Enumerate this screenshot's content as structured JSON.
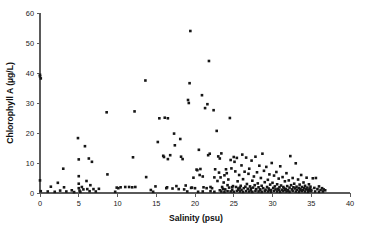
{
  "chart_data": {
    "type": "scatter",
    "title": "",
    "xlabel": "Salinity (psu)",
    "ylabel": "Chlorophyll A (µg/L)",
    "xlim": [
      0,
      40
    ],
    "ylim": [
      0,
      60
    ],
    "xticks": [
      0,
      5,
      10,
      15,
      20,
      25,
      30,
      35,
      40
    ],
    "yticks": [
      0,
      10,
      20,
      30,
      40,
      50,
      60
    ],
    "xtick_labels": [
      "0",
      "5",
      "10",
      "15",
      "20",
      "25",
      "30",
      "35",
      "40"
    ],
    "ytick_labels": [
      "0",
      "10",
      "20",
      "30",
      "40",
      "50",
      "60"
    ],
    "grid": false,
    "legend": false,
    "marker": {
      "shape": "square",
      "color": "#161616",
      "size": 2.6
    },
    "axis_color": "#5a5a5a",
    "background_color": "#ffffff",
    "series": [
      {
        "name": "Chlorophyll A vs Salinity",
        "points": [
          [
            0.0,
            39.4
          ],
          [
            0.0,
            38.9
          ],
          [
            0.1,
            38.2
          ],
          [
            0.0,
            4.2
          ],
          [
            0.1,
            0.6
          ],
          [
            1.0,
            0.5
          ],
          [
            1.4,
            2.1
          ],
          [
            1.9,
            0.4
          ],
          [
            2.3,
            3.4
          ],
          [
            2.6,
            0.8
          ],
          [
            3.0,
            8.1
          ],
          [
            3.1,
            1.9
          ],
          [
            3.4,
            0.5
          ],
          [
            4.1,
            0.9
          ],
          [
            4.4,
            0.3
          ],
          [
            4.9,
            18.3
          ],
          [
            5.0,
            11.2
          ],
          [
            5.0,
            5.6
          ],
          [
            5.0,
            3.1
          ],
          [
            5.0,
            1.6
          ],
          [
            5.1,
            0.8
          ],
          [
            5.2,
            0.4
          ],
          [
            5.4,
            2.0
          ],
          [
            5.6,
            1.2
          ],
          [
            5.8,
            15.6
          ],
          [
            6.0,
            4.0
          ],
          [
            6.1,
            1.3
          ],
          [
            6.3,
            11.5
          ],
          [
            6.4,
            0.6
          ],
          [
            6.5,
            2.6
          ],
          [
            6.7,
            10.4
          ],
          [
            6.9,
            1.3
          ],
          [
            7.2,
            0.5
          ],
          [
            7.6,
            1.4
          ],
          [
            8.6,
            26.9
          ],
          [
            8.7,
            6.2
          ],
          [
            9.7,
            0.4
          ],
          [
            9.9,
            1.8
          ],
          [
            10.1,
            1.6
          ],
          [
            10.4,
            1.9
          ],
          [
            11.0,
            2.0
          ],
          [
            11.5,
            2.0
          ],
          [
            11.9,
            1.9
          ],
          [
            12.0,
            11.9
          ],
          [
            12.2,
            27.2
          ],
          [
            12.3,
            2.0
          ],
          [
            13.6,
            37.5
          ],
          [
            13.7,
            5.3
          ],
          [
            14.3,
            1.0
          ],
          [
            14.6,
            0.4
          ],
          [
            14.9,
            2.2
          ],
          [
            15.2,
            17.0
          ],
          [
            15.4,
            24.9
          ],
          [
            15.9,
            12.4
          ],
          [
            16.0,
            12.0
          ],
          [
            16.1,
            25.1
          ],
          [
            16.3,
            1.6
          ],
          [
            16.4,
            1.9
          ],
          [
            16.5,
            24.9
          ],
          [
            16.5,
            11.3
          ],
          [
            16.8,
            12.6
          ],
          [
            17.1,
            1.5
          ],
          [
            17.3,
            19.8
          ],
          [
            17.4,
            15.9
          ],
          [
            17.6,
            2.3
          ],
          [
            17.9,
            1.3
          ],
          [
            18.1,
            18.0
          ],
          [
            18.2,
            12.1
          ],
          [
            18.4,
            11.3
          ],
          [
            18.6,
            1.2
          ],
          [
            18.8,
            2.5
          ],
          [
            19.1,
            31.0
          ],
          [
            19.2,
            30.0
          ],
          [
            19.3,
            36.6
          ],
          [
            19.4,
            54.0
          ],
          [
            19.5,
            1.7
          ],
          [
            19.6,
            1.8
          ],
          [
            19.8,
            5.1
          ],
          [
            20.0,
            1.6
          ],
          [
            20.2,
            7.8
          ],
          [
            20.3,
            7.6
          ],
          [
            20.5,
            14.4
          ],
          [
            20.6,
            6.0
          ],
          [
            20.7,
            8.0
          ],
          [
            20.9,
            32.6
          ],
          [
            21.0,
            5.5
          ],
          [
            21.1,
            1.9
          ],
          [
            21.3,
            28.3
          ],
          [
            21.5,
            1.6
          ],
          [
            21.6,
            29.6
          ],
          [
            21.7,
            12.6
          ],
          [
            21.8,
            44.0
          ],
          [
            21.9,
            13.1
          ],
          [
            22.0,
            2.0
          ],
          [
            22.2,
            1.6
          ],
          [
            22.4,
            27.6
          ],
          [
            22.5,
            5.2
          ],
          [
            22.6,
            7.9
          ],
          [
            22.8,
            20.7
          ],
          [
            22.9,
            4.0
          ],
          [
            23.0,
            12.2
          ],
          [
            23.1,
            6.8
          ],
          [
            23.2,
            11.5
          ],
          [
            23.3,
            5.2
          ],
          [
            23.4,
            13.2
          ],
          [
            23.5,
            2.0
          ],
          [
            23.6,
            1.4
          ],
          [
            23.7,
            3.5
          ],
          [
            23.8,
            5.9
          ],
          [
            23.9,
            1.2
          ],
          [
            24.0,
            7.9
          ],
          [
            24.1,
            6.6
          ],
          [
            24.2,
            2.6
          ],
          [
            24.3,
            4.5
          ],
          [
            24.4,
            1.8
          ],
          [
            24.5,
            25.0
          ],
          [
            24.6,
            11.0
          ],
          [
            24.7,
            8.2
          ],
          [
            24.8,
            1.9
          ],
          [
            24.9,
            2.3
          ],
          [
            25.0,
            12.0
          ],
          [
            25.1,
            10.4
          ],
          [
            25.2,
            7.2
          ],
          [
            25.3,
            2.0
          ],
          [
            25.4,
            11.7
          ],
          [
            25.5,
            3.9
          ],
          [
            25.6,
            1.5
          ],
          [
            25.7,
            6.0
          ],
          [
            25.8,
            1.8
          ],
          [
            25.9,
            2.4
          ],
          [
            26.0,
            9.2
          ],
          [
            26.1,
            12.8
          ],
          [
            26.2,
            4.6
          ],
          [
            26.3,
            1.6
          ],
          [
            26.4,
            7.1
          ],
          [
            26.5,
            2.1
          ],
          [
            26.6,
            11.8
          ],
          [
            26.7,
            3.0
          ],
          [
            26.8,
            1.4
          ],
          [
            26.9,
            6.4
          ],
          [
            27.0,
            8.1
          ],
          [
            27.1,
            2.2
          ],
          [
            27.2,
            1.5
          ],
          [
            27.3,
            10.8
          ],
          [
            27.4,
            4.1
          ],
          [
            27.5,
            1.8
          ],
          [
            27.6,
            5.5
          ],
          [
            27.7,
            2.6
          ],
          [
            27.8,
            12.1
          ],
          [
            27.9,
            1.3
          ],
          [
            28.0,
            6.9
          ],
          [
            28.1,
            3.2
          ],
          [
            28.2,
            1.9
          ],
          [
            28.3,
            9.1
          ],
          [
            28.4,
            1.2
          ],
          [
            28.5,
            5.0
          ],
          [
            28.6,
            2.4
          ],
          [
            28.7,
            13.1
          ],
          [
            28.8,
            1.6
          ],
          [
            28.9,
            7.4
          ],
          [
            29.0,
            3.6
          ],
          [
            29.1,
            1.1
          ],
          [
            29.2,
            8.7
          ],
          [
            29.3,
            2.0
          ],
          [
            29.4,
            4.4
          ],
          [
            29.5,
            1.5
          ],
          [
            29.6,
            6.2
          ],
          [
            29.7,
            2.8
          ],
          [
            29.8,
            1.0
          ],
          [
            29.9,
            10.0
          ],
          [
            30.0,
            3.4
          ],
          [
            30.1,
            1.7
          ],
          [
            30.2,
            5.8
          ],
          [
            30.3,
            2.2
          ],
          [
            30.4,
            1.2
          ],
          [
            30.5,
            7.0
          ],
          [
            30.6,
            2.9
          ],
          [
            30.7,
            1.4
          ],
          [
            30.8,
            4.8
          ],
          [
            30.9,
            1.9
          ],
          [
            31.0,
            8.9
          ],
          [
            31.1,
            2.5
          ],
          [
            31.2,
            1.1
          ],
          [
            31.3,
            5.3
          ],
          [
            31.4,
            2.0
          ],
          [
            31.5,
            1.6
          ],
          [
            31.6,
            3.9
          ],
          [
            31.7,
            1.3
          ],
          [
            31.8,
            6.6
          ],
          [
            31.9,
            2.3
          ],
          [
            32.0,
            1.0
          ],
          [
            32.1,
            4.2
          ],
          [
            32.2,
            1.8
          ],
          [
            32.3,
            12.3
          ],
          [
            32.4,
            2.6
          ],
          [
            32.5,
            1.2
          ],
          [
            32.6,
            5.0
          ],
          [
            32.7,
            1.9
          ],
          [
            32.8,
            3.1
          ],
          [
            32.9,
            1.5
          ],
          [
            33.0,
            9.9
          ],
          [
            33.1,
            2.1
          ],
          [
            33.2,
            1.1
          ],
          [
            33.3,
            4.5
          ],
          [
            33.4,
            1.7
          ],
          [
            33.5,
            2.8
          ],
          [
            33.6,
            1.3
          ],
          [
            33.7,
            6.0
          ],
          [
            33.8,
            2.0
          ],
          [
            33.9,
            1.0
          ],
          [
            34.0,
            3.5
          ],
          [
            34.1,
            1.6
          ],
          [
            34.2,
            2.4
          ],
          [
            34.3,
            1.2
          ],
          [
            34.4,
            5.1
          ],
          [
            34.5,
            1.8
          ],
          [
            34.6,
            1.0
          ],
          [
            34.7,
            2.9
          ],
          [
            34.8,
            1.4
          ],
          [
            34.9,
            2.1
          ],
          [
            35.0,
            1.1
          ],
          [
            35.2,
            4.9
          ],
          [
            35.4,
            1.7
          ],
          [
            35.6,
            5.0
          ],
          [
            35.8,
            1.3
          ],
          [
            36.0,
            2.2
          ],
          [
            36.2,
            1.0
          ],
          [
            36.4,
            1.6
          ],
          [
            36.6,
            1.2
          ],
          [
            36.8,
            0.9
          ],
          [
            23.4,
            0.5
          ],
          [
            23.8,
            0.4
          ],
          [
            24.2,
            0.6
          ],
          [
            24.6,
            0.5
          ],
          [
            25.0,
            0.4
          ],
          [
            25.4,
            0.7
          ],
          [
            25.8,
            0.5
          ],
          [
            26.2,
            0.4
          ],
          [
            26.6,
            0.6
          ],
          [
            27.0,
            0.5
          ],
          [
            27.4,
            0.4
          ],
          [
            27.8,
            0.7
          ],
          [
            28.2,
            0.5
          ],
          [
            28.6,
            0.4
          ],
          [
            29.0,
            0.6
          ],
          [
            29.4,
            0.5
          ],
          [
            29.8,
            0.4
          ],
          [
            30.2,
            0.7
          ],
          [
            30.6,
            0.5
          ],
          [
            31.0,
            0.4
          ],
          [
            31.4,
            0.6
          ],
          [
            31.8,
            0.5
          ],
          [
            32.2,
            0.4
          ],
          [
            32.6,
            0.7
          ],
          [
            33.0,
            0.5
          ],
          [
            33.4,
            0.4
          ],
          [
            33.8,
            0.6
          ],
          [
            34.2,
            0.5
          ],
          [
            34.6,
            0.4
          ],
          [
            35.0,
            0.6
          ],
          [
            35.5,
            0.5
          ],
          [
            36.0,
            0.4
          ],
          [
            36.5,
            0.5
          ],
          [
            22.0,
            0.6
          ],
          [
            22.5,
            0.4
          ],
          [
            21.0,
            0.5
          ],
          [
            20.4,
            0.4
          ],
          [
            19.0,
            0.5
          ],
          [
            26.0,
            1.0
          ],
          [
            27.2,
            0.9
          ],
          [
            28.4,
            1.0
          ],
          [
            29.6,
            0.9
          ],
          [
            30.8,
            1.0
          ],
          [
            32.0,
            0.8
          ],
          [
            33.6,
            0.9
          ],
          [
            34.8,
            0.8
          ],
          [
            25.6,
            1.1
          ],
          [
            24.8,
            1.0
          ],
          [
            23.2,
            0.9
          ],
          [
            31.6,
            1.1
          ]
        ]
      }
    ]
  }
}
